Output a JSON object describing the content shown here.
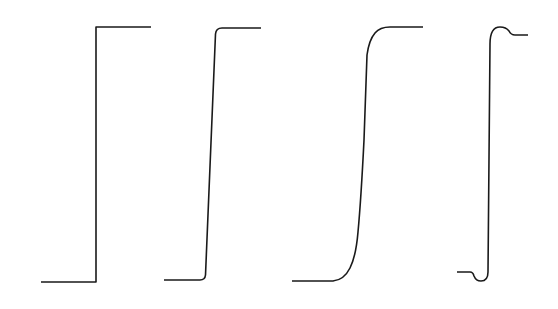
{
  "diagram": {
    "stroke_color": "#1a1a1a",
    "background_color": "#ffffff",
    "waveforms": [
      {
        "id": "ideal-step",
        "label": "Ideal step (zero rise time)",
        "low_level_y": 282,
        "high_level_y": 27,
        "x_start": 41,
        "x_edge": 96,
        "x_end": 151
      },
      {
        "id": "fast-rise",
        "label": "Fast edge with finite rise time",
        "low_level_y": 280,
        "high_level_y": 28,
        "x_start": 164,
        "x_edge_start": 205,
        "x_edge_end": 216,
        "x_end": 261
      },
      {
        "id": "slow-rise",
        "label": "Slow rounded edge",
        "low_level_y": 281,
        "high_level_y": 27,
        "x_start": 292,
        "x_edge_start": 335,
        "x_edge_end": 385,
        "x_end": 423
      },
      {
        "id": "ringing",
        "label": "Edge with undershoot and overshoot",
        "low_level_y": 272,
        "undershoot_y": 280,
        "high_level_y": 35,
        "overshoot_y": 27,
        "x_start": 457,
        "x_edge": 489,
        "x_end": 528
      }
    ]
  }
}
